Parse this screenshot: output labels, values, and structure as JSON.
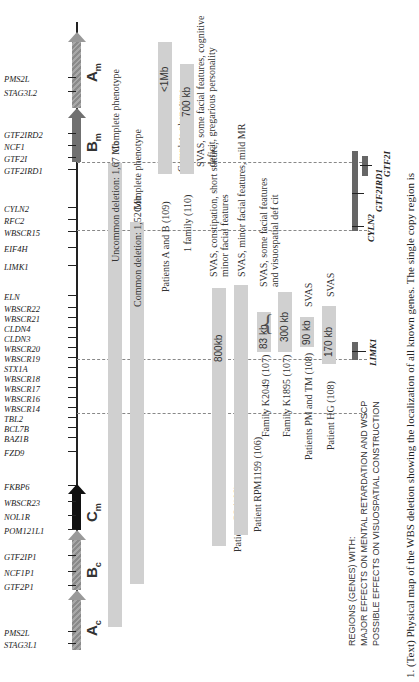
{
  "figure": {
    "caption": "1. (Text) Physical map of the WBS deletion showing the localization of all known genes. The single copy region is",
    "segments": [
      {
        "label": "A",
        "sub": "c",
        "style": "grey"
      },
      {
        "label": "B",
        "sub": "c",
        "style": "grey"
      },
      {
        "label": "C",
        "sub": "m",
        "style": "black"
      },
      {
        "label": "B",
        "sub": "m",
        "style": "dark"
      },
      {
        "label": "A",
        "sub": "m",
        "style": "grey"
      }
    ],
    "genes": [
      "STAG3L1",
      "PMS2L",
      "GTF2P1",
      "NCF1P1",
      "GTF2IP1",
      "POM121L1",
      "NOL1R",
      "WBSCR23",
      "FKBP6",
      "FZD9",
      "BAZ1B",
      "BCL7B",
      "TBL2",
      "WBSCR14",
      "WBSCR16",
      "WBSCR17",
      "WBSCR18",
      "STX1A",
      "WBSCR19",
      "WBSCR20",
      "CLDN3",
      "CLDN4",
      "WBSCR21",
      "WBSCR22",
      "ELN",
      "LIMK1",
      "EIF4H",
      "WBSCR15",
      "RFC2",
      "CYLN2",
      "GTF2IRD1",
      "GTF2I",
      "NCF1",
      "GTF2IRD2",
      "STAG3L2",
      "PMS2L"
    ],
    "deletions": [
      {
        "label": "Uncommon deletion: 1,67 Mb",
        "size": "",
        "phenotype": "Complete phenotype"
      },
      {
        "label": "Common deletion: 1,52 Mb",
        "size": "",
        "phenotype": "Complete phenotype"
      },
      {
        "label": "Patients A and B (109)",
        "size": "<1Mb",
        "phenotype": "Complete phenotype"
      },
      {
        "label": "1 family (110)",
        "size": "700 kb",
        "phenotype": "SVAS, some facial features, cognitive deficit, gregarious personality"
      },
      {
        "label": "Patient CS (108)",
        "size": "800kb",
        "phenotype": "SVAS, constipation, short stature, minor facial features"
      },
      {
        "label": "Patient RPM1199 (106)",
        "size": "",
        "phenotype": "SVAS, minor facial features, mild MR"
      },
      {
        "label": "Family K2049 (107)",
        "size": "83 kb",
        "phenotype": ""
      },
      {
        "label": "Family K1895 (107)",
        "size": "300 kb",
        "phenotype": ""
      },
      {
        "label": "Patients PM and TM (108)",
        "size": "90 kb",
        "phenotype": "SVAS"
      },
      {
        "label": "Patient HG (108)",
        "size": "170 kb",
        "phenotype": "SVAS"
      }
    ],
    "shared_phenotype": {
      "line1": "SVAS, some facial features",
      "line2": "and visuospatial def cit"
    },
    "regions_legend": {
      "line1": "REGIONS (GENES) WITH:",
      "line2": "MAJOR EFFECTS ON MENTAL RETARDATION AND WSCP",
      "line3": "POSSIBLE EFFECTS ON VISUOSPATIAL CONSTRUCTION"
    },
    "region_genes": [
      "LIMK1",
      "CYLN2",
      "GTF2IRD1",
      "GTF2I"
    ]
  }
}
